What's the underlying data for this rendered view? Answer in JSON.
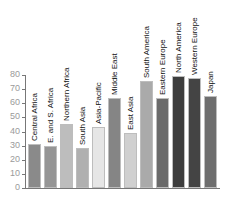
{
  "chart_data": {
    "type": "bar",
    "title": "",
    "xlabel": "",
    "ylabel": "",
    "ylim": [
      0,
      80
    ],
    "yticks": [
      0,
      10,
      20,
      30,
      40,
      50,
      60,
      70,
      80
    ],
    "grid": false,
    "legend": null,
    "label_position": "rotated above each bar",
    "categories": [
      "Central Africa",
      "E. and S. Africa",
      "Northern Africa",
      "South Asia",
      "Asia-Pacific",
      "Middle East",
      "East Asia",
      "South America",
      "Eastern Europe",
      "North America",
      "Western Europe",
      "Japan"
    ],
    "values": [
      31,
      30,
      45,
      28,
      43,
      64,
      39,
      76,
      64,
      79,
      78,
      65
    ],
    "colors": [
      "#8a8a8a",
      "#959595",
      "#bdbdbd",
      "#b0b0b0",
      "#e6e6e6",
      "#858585",
      "#d0d0d0",
      "#aaaaaa",
      "#6a6a6a",
      "#3d3d3d",
      "#444444",
      "#6e6e6e"
    ]
  }
}
